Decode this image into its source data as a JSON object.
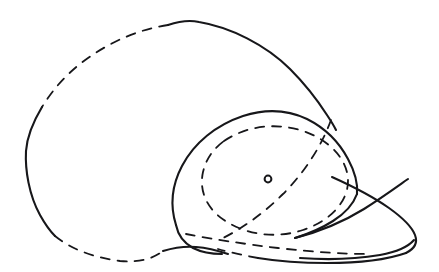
{
  "canvas": {
    "width": 439,
    "height": 272,
    "background_color": "#ffffff",
    "ink_color": "#17171a",
    "title": "Hand-drawn perspective line sketch of a cap"
  },
  "figure": {
    "subject": "cap",
    "style": "hand-drawn ink line art",
    "stroke_weight_px": 2,
    "has_text_labels": false,
    "visible_text": "",
    "marker": {
      "name": "center-dot",
      "shape": "small open circle",
      "cx": 268,
      "cy": 179,
      "radius": 3.4
    }
  },
  "strokes": [
    {
      "name": "outer-shell-top-solid",
      "style": "solid",
      "description": "Large upper-right arc of the outer ellipsoid shell, from apex down the right side",
      "path": "M 168 25 C 180 21 190 20 199 22 C 230 27 266 45 290 69 C 306 85 318 101 327 115 C 331 121 334 126 336 130"
    },
    {
      "name": "outer-shell-top-dashed",
      "style": "dashed",
      "description": "Hidden upper-left arc of the outer ellipsoid shell",
      "path": "M 168 25 C 140 29 112 41 88 58 C 68 72 53 89 42 107"
    },
    {
      "name": "outer-shell-left-solid",
      "style": "solid",
      "description": "Visible left side of the outer shell curving around the leftmost point",
      "path": "M 42 107 C 33 122 27 137 26 151 C 25 170 29 195 40 215 C 45 224 50 231 55 236"
    },
    {
      "name": "outer-shell-bottom-dashed",
      "style": "dashed",
      "description": "Hidden bottom-left arc of the outer shell running right along the base",
      "path": "M 55 236 C 72 250 96 258 120 261 C 140 263 154 258 163 251"
    },
    {
      "name": "outer-shell-base-solid",
      "style": "solid",
      "description": "Short solid base segment beneath the crown where the shell meets the cap",
      "path": "M 163 251 C 173 248 184 246 196 247 C 209 248 219 251 228 254"
    },
    {
      "name": "crown-outline-solid",
      "style": "solid",
      "description": "Solid outline of the cap crown, left lobe up over the top and down to the right",
      "path": "M 176 225 C 170 206 172 185 182 166 C 194 143 216 125 243 116 C 265 109 288 110 307 119 C 325 128 339 142 348 159 C 355 172 358 184 357 194"
    },
    {
      "name": "crown-left-lower-solid",
      "style": "solid",
      "description": "Lower-left edge of the crown closing down to the base",
      "path": "M 176 225 C 178 235 184 243 193 248 C 201 252 211 254 222 254"
    },
    {
      "name": "crown-seam-right-solid",
      "style": "solid",
      "description": "Right seam of crown sweeping down toward the brim",
      "path": "M 357 194 C 353 205 344 214 333 221 C 322 228 308 234 295 238"
    },
    {
      "name": "head-ellipse-dashed",
      "style": "dashed",
      "description": "Tilted dashed ellipse representing the hidden head opening inside the crown",
      "path": "M 224 141 C 246 126 276 122 303 131 C 330 140 348 160 348 181 C 348 202 330 221 303 230 C 276 239 246 235 224 220 C 206 208 199 190 203 172 C 206 159 213 149 224 141 Z"
    },
    {
      "name": "crossing-chord-upper-dashed",
      "style": "dashed",
      "description": "Dashed construction chord from the upper right of the crown down to the lower left",
      "path": "M 331 120 C 322 145 305 172 283 194 C 264 213 243 228 223 238"
    },
    {
      "name": "crossing-chord-lower-dashed",
      "style": "dashed",
      "description": "Dashed construction chord running from the left base out to the lower right of the brim",
      "path": "M 186 234 C 212 239 244 244 278 248 C 312 252 344 254 370 254"
    },
    {
      "name": "brim-top-solid",
      "style": "solid",
      "description": "Top edge of the visor/brim extending to the right tip",
      "path": "M 295 238 C 318 232 343 222 364 209 C 383 197 398 186 408 179"
    },
    {
      "name": "brim-front-solid",
      "style": "solid",
      "description": "Leading outer edge of the brim curving around the right tip",
      "path": "M 332 177 C 352 186 372 196 389 208 C 403 218 412 227 415 235 C 418 243 414 249 406 253"
    },
    {
      "name": "brim-bottom-solid",
      "style": "solid",
      "description": "Lower underside edge of the brim returning left",
      "path": "M 406 253 C 386 260 357 263 327 263 C 300 263 276 261 258 258"
    },
    {
      "name": "brim-underside-dashed",
      "style": "dashed",
      "description": "Dashed hidden underside line of the brim toward the left",
      "path": "M 258 258 C 242 255 228 252 218 249"
    },
    {
      "name": "brim-rim-double-solid",
      "style": "solid",
      "description": "Second thin line paralleling the brim tip giving it thickness",
      "path": "M 414 240 C 408 247 396 252 380 255 C 356 259 327 260 300 258"
    }
  ],
  "legend": {
    "solid_meaning": "visible contour edge",
    "dashed_meaning": "hidden / construction edge"
  }
}
